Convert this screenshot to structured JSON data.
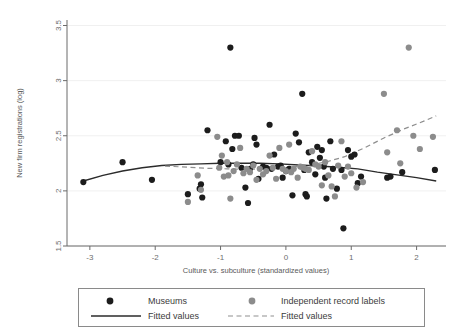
{
  "chart_data": {
    "type": "scatter",
    "title": "",
    "xlabel": "Culture vs. subculture (standardized values)",
    "ylabel": "New firm registrations (log)",
    "xlim": [
      -3.35,
      2.45
    ],
    "ylim": [
      1.5,
      3.55
    ],
    "xticks": [
      -3,
      -2,
      -1,
      0,
      1,
      2
    ],
    "xticklabels": [
      "-3",
      "-2",
      "-1",
      "0",
      "1",
      "2"
    ],
    "yticks": [
      1.5,
      2,
      2.5,
      3,
      3.5
    ],
    "yticklabels": [
      "1.5",
      "2",
      "2.5",
      "3",
      "3.5"
    ],
    "grid": "horizontal-faint",
    "legend_position": "below",
    "colors": {
      "museums": "#1c1c1c",
      "independent_record_labels": "#8c8c8c",
      "fitted_museums": "#2b2b2b",
      "fitted_labels": "#8f8f8f",
      "axis": "#6b6b6b",
      "grid": "#f0f0f0"
    },
    "series": [
      {
        "name": "Museums",
        "marker": "circle",
        "color": "#1c1c1c",
        "points": [
          [
            -3.1,
            2.08
          ],
          [
            -2.5,
            2.26
          ],
          [
            -2.05,
            2.1
          ],
          [
            -1.5,
            1.97
          ],
          [
            -1.32,
            2.02
          ],
          [
            -1.3,
            2.06
          ],
          [
            -1.28,
            1.94
          ],
          [
            -1.2,
            2.55
          ],
          [
            -1.0,
            2.26
          ],
          [
            -0.92,
            2.45
          ],
          [
            -0.88,
            2.24
          ],
          [
            -0.85,
            3.3
          ],
          [
            -0.82,
            2.38
          ],
          [
            -0.78,
            2.5
          ],
          [
            -0.72,
            2.5
          ],
          [
            -0.68,
            2.21
          ],
          [
            -0.62,
            2.03
          ],
          [
            -0.58,
            1.89
          ],
          [
            -0.55,
            2.2
          ],
          [
            -0.5,
            2.24
          ],
          [
            -0.48,
            2.48
          ],
          [
            -0.45,
            2.42
          ],
          [
            -0.42,
            2.11
          ],
          [
            -0.35,
            2.22
          ],
          [
            -0.3,
            2.21
          ],
          [
            -0.25,
            2.6
          ],
          [
            -0.22,
            2.2
          ],
          [
            -0.18,
            2.33
          ],
          [
            -0.12,
            2.22
          ],
          [
            -0.08,
            2.23
          ],
          [
            -0.05,
            2.12
          ],
          [
            0.0,
            2.18
          ],
          [
            0.05,
            2.2
          ],
          [
            0.1,
            1.96
          ],
          [
            0.15,
            2.52
          ],
          [
            0.2,
            2.44
          ],
          [
            0.25,
            2.88
          ],
          [
            0.28,
            2.19
          ],
          [
            0.3,
            1.97
          ],
          [
            0.32,
            1.95
          ],
          [
            0.35,
            2.35
          ],
          [
            0.4,
            2.26
          ],
          [
            0.45,
            2.15
          ],
          [
            0.48,
            2.4
          ],
          [
            0.52,
            2.3
          ],
          [
            0.55,
            2.37
          ],
          [
            0.58,
            2.22
          ],
          [
            0.6,
            2.12
          ],
          [
            0.62,
            1.93
          ],
          [
            0.68,
            2.45
          ],
          [
            0.72,
            2.2
          ],
          [
            0.78,
            2.02
          ],
          [
            0.85,
            2.19
          ],
          [
            0.88,
            1.66
          ],
          [
            0.95,
            2.37
          ],
          [
            1.0,
            2.31
          ],
          [
            1.05,
            2.33
          ],
          [
            1.1,
            2.07
          ],
          [
            1.15,
            2.13
          ],
          [
            1.55,
            2.12
          ],
          [
            1.6,
            2.13
          ],
          [
            1.78,
            2.17
          ],
          [
            2.28,
            2.19
          ]
        ]
      },
      {
        "name": "Independent record labels",
        "marker": "circle",
        "color": "#8c8c8c",
        "points": [
          [
            -1.5,
            1.9
          ],
          [
            -1.35,
            2.14
          ],
          [
            -1.3,
            2.01
          ],
          [
            -1.05,
            2.49
          ],
          [
            -1.02,
            2.21
          ],
          [
            -0.98,
            2.32
          ],
          [
            -0.95,
            2.13
          ],
          [
            -0.9,
            2.26
          ],
          [
            -0.88,
            2.14
          ],
          [
            -0.85,
            1.93
          ],
          [
            -0.8,
            2.18
          ],
          [
            -0.75,
            2.24
          ],
          [
            -0.7,
            2.39
          ],
          [
            -0.65,
            2.16
          ],
          [
            -0.6,
            2.2
          ],
          [
            -0.55,
            2.17
          ],
          [
            -0.5,
            2.23
          ],
          [
            -0.45,
            2.1
          ],
          [
            -0.4,
            2.2
          ],
          [
            -0.35,
            2.15
          ],
          [
            -0.3,
            2.18
          ],
          [
            -0.25,
            2.32
          ],
          [
            -0.2,
            2.21
          ],
          [
            -0.15,
            2.11
          ],
          [
            -0.1,
            2.39
          ],
          [
            -0.05,
            2.2
          ],
          [
            0.0,
            2.18
          ],
          [
            0.05,
            2.42
          ],
          [
            0.08,
            2.17
          ],
          [
            0.12,
            2.2
          ],
          [
            0.18,
            2.12
          ],
          [
            0.22,
            2.22
          ],
          [
            0.26,
            2.21
          ],
          [
            0.3,
            2.2
          ],
          [
            0.35,
            2.19
          ],
          [
            0.4,
            2.36
          ],
          [
            0.45,
            2.24
          ],
          [
            0.5,
            2.22
          ],
          [
            0.55,
            2.05
          ],
          [
            0.6,
            2.26
          ],
          [
            0.65,
            2.14
          ],
          [
            0.7,
            2.04
          ],
          [
            0.75,
            1.95
          ],
          [
            0.8,
            2.23
          ],
          [
            0.85,
            2.45
          ],
          [
            0.9,
            2.13
          ],
          [
            0.95,
            2.22
          ],
          [
            1.0,
            2.16
          ],
          [
            1.08,
            2.03
          ],
          [
            1.18,
            2.08
          ],
          [
            1.5,
            2.88
          ],
          [
            1.55,
            2.35
          ],
          [
            1.7,
            2.55
          ],
          [
            1.75,
            2.25
          ],
          [
            1.88,
            3.3
          ],
          [
            1.95,
            2.5
          ],
          [
            2.05,
            2.38
          ],
          [
            2.25,
            2.49
          ]
        ]
      }
    ],
    "fits": [
      {
        "name": "Fitted values",
        "style": "solid",
        "color": "#2b2b2b",
        "legend_for": "Museums",
        "path": [
          [
            -3.1,
            2.09
          ],
          [
            -2.8,
            2.14
          ],
          [
            -2.5,
            2.18
          ],
          [
            -2.2,
            2.21
          ],
          [
            -1.9,
            2.23
          ],
          [
            -1.6,
            2.24
          ],
          [
            -1.3,
            2.245
          ],
          [
            -1.0,
            2.25
          ],
          [
            -0.7,
            2.25
          ],
          [
            -0.4,
            2.25
          ],
          [
            -0.1,
            2.245
          ],
          [
            0.2,
            2.235
          ],
          [
            0.5,
            2.225
          ],
          [
            0.8,
            2.215
          ],
          [
            1.1,
            2.2
          ],
          [
            1.4,
            2.17
          ],
          [
            1.7,
            2.145
          ],
          [
            2.0,
            2.12
          ],
          [
            2.3,
            2.09
          ]
        ]
      },
      {
        "name": "Fitted values",
        "style": "dashed",
        "color": "#8f8f8f",
        "legend_for": "Independent record labels",
        "path": [
          [
            -1.85,
            2.225
          ],
          [
            -1.5,
            2.215
          ],
          [
            -1.2,
            2.205
          ],
          [
            -0.9,
            2.2
          ],
          [
            -0.6,
            2.195
          ],
          [
            -0.3,
            2.2
          ],
          [
            0.0,
            2.21
          ],
          [
            0.3,
            2.23
          ],
          [
            0.6,
            2.26
          ],
          [
            0.9,
            2.31
          ],
          [
            1.2,
            2.39
          ],
          [
            1.5,
            2.48
          ],
          [
            1.8,
            2.56
          ],
          [
            2.1,
            2.63
          ],
          [
            2.3,
            2.68
          ]
        ]
      }
    ],
    "legend": {
      "entries": [
        {
          "label": "Museums",
          "symbol": "dot",
          "color": "#1c1c1c"
        },
        {
          "label": "Independent record labels",
          "symbol": "dot",
          "color": "#8c8c8c"
        },
        {
          "label": "Fitted values",
          "symbol": "solid-line",
          "color": "#2b2b2b"
        },
        {
          "label": "Fitted values",
          "symbol": "dashed-line",
          "color": "#8f8f8f"
        }
      ]
    }
  }
}
